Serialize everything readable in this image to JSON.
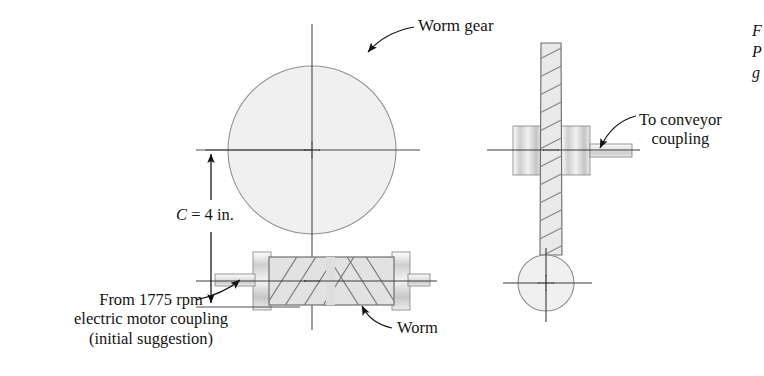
{
  "figure": {
    "type": "engineering-drawing",
    "background_color": "#ffffff",
    "line_color": "#3a3a3a",
    "fill_light": "#f0f0f0",
    "fill_mid": "#d8d8d8",
    "hatch_color": "#7d7d7d"
  },
  "labels": {
    "worm_gear": "Worm gear",
    "to_conveyor_line1": "To conveyor",
    "to_conveyor_line2": "coupling",
    "center_distance_symbol": "C",
    "center_distance_value": " = 4 in.",
    "from_motor_line1": "From 1775 rpm",
    "from_motor_line2": "electric motor coupling",
    "from_motor_line3": "(initial suggestion)",
    "worm": "Worm",
    "caption_line1": "F",
    "caption_line2": "P",
    "caption_line3": "g"
  },
  "dimensions": {
    "center_distance": "C = 4 in.",
    "input_speed_rpm": "1775"
  },
  "geometry": {
    "front_view": {
      "gear_center_x": 312,
      "gear_center_y": 150,
      "gear_radius": 84,
      "worm_x": 269,
      "worm_y": 257,
      "worm_width": 125,
      "worm_height": 48
    },
    "side_view": {
      "gear_web_center_x": 551,
      "gear_top_y": 43,
      "gear_bottom_y": 255,
      "shaft_y": 150,
      "worm_circle_center_x": 546,
      "worm_circle_center_y": 283,
      "worm_circle_radius": 28
    }
  }
}
